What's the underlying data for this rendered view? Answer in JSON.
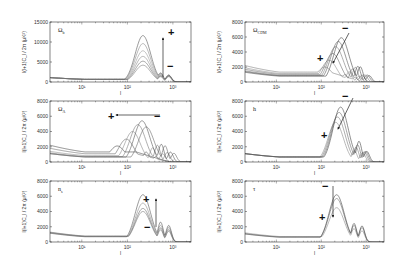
{
  "figure": {
    "ylabel": "l(l+1)C_l / 2π   (μ K²)",
    "xlabel": "l"
  },
  "chart_data": [
    {
      "type": "line",
      "id": "omega-b",
      "title": "Ω_b",
      "title_main": "Ω",
      "title_sub": "b",
      "xscale": "log",
      "xlim": [
        2,
        2500
      ],
      "ylim": [
        0,
        15000
      ],
      "yticks": [
        0,
        5000,
        10000,
        15000
      ],
      "xticks": [
        10,
        100,
        1000
      ],
      "xticklabels": [
        "10¹",
        "10²",
        "10³"
      ],
      "xlabel": "l",
      "ylabel": "l(l+1)C_l / 2π (μK²)",
      "arrow": {
        "direction": "up",
        "plus": "+",
        "minus": "−",
        "plus_at": "top"
      },
      "series": [
        {
          "name": "curve-1",
          "low": 1100,
          "p1": [
            220,
            4200
          ],
          "p2": [
            540,
            1500
          ],
          "p3": [
            820,
            1900
          ],
          "color": "#777"
        },
        {
          "name": "curve-2",
          "low": 1100,
          "p1": [
            220,
            5200
          ],
          "p2": [
            540,
            1700
          ],
          "p3": [
            820,
            2100
          ],
          "color": "#666"
        },
        {
          "name": "curve-3",
          "low": 1100,
          "p1": [
            220,
            6400
          ],
          "p2": [
            540,
            1900
          ],
          "p3": [
            820,
            2200
          ],
          "color": "#888"
        },
        {
          "name": "curve-4",
          "low": 1100,
          "p1": [
            220,
            7800
          ],
          "p2": [
            540,
            2100
          ],
          "p3": [
            820,
            2300
          ],
          "color": "#999"
        },
        {
          "name": "curve-5",
          "low": 1100,
          "p1": [
            220,
            9600
          ],
          "p2": [
            540,
            2400
          ],
          "p3": [
            820,
            2400
          ],
          "color": "#888"
        },
        {
          "name": "curve-6",
          "low": 1100,
          "p1": [
            220,
            11600
          ],
          "p2": [
            540,
            2600
          ],
          "p3": [
            820,
            2500
          ],
          "color": "#555"
        }
      ]
    },
    {
      "type": "line",
      "id": "omega-cdm",
      "title": "Ω_CDM",
      "title_main": "Ω",
      "title_sub": "CDM",
      "xscale": "log",
      "xlim": [
        2,
        2500
      ],
      "ylim": [
        0,
        8000
      ],
      "yticks": [
        0,
        2000,
        4000,
        6000,
        8000
      ],
      "xticks": [
        10,
        100,
        1000
      ],
      "xticklabels": [
        "10¹",
        "10²",
        "10³"
      ],
      "xlabel": "l",
      "ylabel": "l(l+1)C_l / 2π (μK²)",
      "arrow": {
        "direction": "diagonal-down-left",
        "plus": "+",
        "minus": "−",
        "plus_at": "bottom"
      },
      "series": [
        {
          "name": "curve-1",
          "low": 2200,
          "p1": [
            120,
            2000
          ],
          "p2": [
            340,
            900
          ],
          "p3": [
            560,
            700
          ],
          "color": "#777"
        },
        {
          "name": "curve-2",
          "low": 1900,
          "p1": [
            150,
            2900
          ],
          "p2": [
            420,
            1400
          ],
          "p3": [
            700,
            1000
          ],
          "color": "#888"
        },
        {
          "name": "curve-3",
          "low": 1700,
          "p1": [
            180,
            3800
          ],
          "p2": [
            500,
            1900
          ],
          "p3": [
            820,
            1300
          ],
          "color": "#666"
        },
        {
          "name": "curve-4",
          "low": 1500,
          "p1": [
            210,
            4700
          ],
          "p2": [
            580,
            2300
          ],
          "p3": [
            950,
            1500
          ],
          "color": "#777"
        },
        {
          "name": "curve-5",
          "low": 1400,
          "p1": [
            240,
            5400
          ],
          "p2": [
            660,
            2600
          ],
          "p3": [
            1080,
            1700
          ],
          "color": "#555"
        },
        {
          "name": "curve-6",
          "low": 1300,
          "p1": [
            280,
            5900
          ],
          "p2": [
            750,
            2700
          ],
          "p3": [
            1200,
            1800
          ],
          "color": "#444"
        }
      ]
    },
    {
      "type": "line",
      "id": "omega-lambda",
      "title": "Ω_Λ",
      "title_main": "Ω",
      "title_sub": "Λ",
      "xscale": "log",
      "xlim": [
        2,
        2500
      ],
      "ylim": [
        0,
        8000
      ],
      "yticks": [
        0,
        2000,
        4000,
        6000,
        8000
      ],
      "xticks": [
        10,
        100,
        1000
      ],
      "xticklabels": [
        "10¹",
        "10²",
        "10³"
      ],
      "xlabel": "l",
      "ylabel": "l(l+1)C_l / 2π (μK²)",
      "arrow": {
        "direction": "left",
        "plus": "+",
        "minus": "−",
        "plus_at": "left"
      },
      "series": [
        {
          "name": "curve-1",
          "low": 2200,
          "p1": [
            60,
            2100
          ],
          "p2": [
            160,
            600
          ],
          "p3": [
            280,
            400
          ],
          "color": "#444"
        },
        {
          "name": "curve-2",
          "low": 1800,
          "p1": [
            95,
            3000
          ],
          "p2": [
            260,
            1200
          ],
          "p3": [
            430,
            800
          ],
          "color": "#666"
        },
        {
          "name": "curve-3",
          "low": 1400,
          "p1": [
            130,
            4000
          ],
          "p2": [
            360,
            1900
          ],
          "p3": [
            600,
            1300
          ],
          "color": "#888"
        },
        {
          "name": "curve-4",
          "low": 1200,
          "p1": [
            170,
            4900
          ],
          "p2": [
            460,
            2400
          ],
          "p3": [
            760,
            1700
          ],
          "color": "#777"
        },
        {
          "name": "curve-5",
          "low": 1100,
          "p1": [
            210,
            5400
          ],
          "p2": [
            560,
            2700
          ],
          "p3": [
            900,
            2000
          ],
          "color": "#555"
        },
        {
          "name": "curve-6",
          "low": 1100,
          "p1": [
            260,
            4600
          ],
          "p2": [
            680,
            2700
          ],
          "p3": [
            1080,
            2100
          ],
          "color": "#666"
        }
      ]
    },
    {
      "type": "line",
      "id": "hubble-h",
      "title": "h",
      "title_main": "h",
      "title_sub": "",
      "xscale": "log",
      "xlim": [
        2,
        2500
      ],
      "ylim": [
        0,
        8000
      ],
      "yticks": [
        0,
        2000,
        4000,
        6000,
        8000
      ],
      "xticks": [
        10,
        100,
        1000
      ],
      "xticklabels": [
        "10¹",
        "10²",
        "10³"
      ],
      "xlabel": "l",
      "ylabel": "l(l+1)C_l / 2π (μK²)",
      "arrow": {
        "direction": "diagonal-down-left",
        "plus": "+",
        "minus": "−",
        "plus_at": "bottom"
      },
      "series": [
        {
          "name": "curve-1",
          "low": 1100,
          "p1": [
            210,
            5200
          ],
          "p2": [
            550,
            1700
          ],
          "p3": [
            850,
            1800
          ],
          "color": "#888"
        },
        {
          "name": "curve-2",
          "low": 1100,
          "p1": [
            230,
            5900
          ],
          "p2": [
            600,
            2300
          ],
          "p3": [
            920,
            2100
          ],
          "color": "#777"
        },
        {
          "name": "curve-3",
          "low": 1100,
          "p1": [
            250,
            6500
          ],
          "p2": [
            650,
            2800
          ],
          "p3": [
            990,
            2300
          ],
          "color": "#666"
        },
        {
          "name": "curve-4",
          "low": 1100,
          "p1": [
            270,
            7200
          ],
          "p2": [
            700,
            3500
          ],
          "p3": [
            1060,
            2500
          ],
          "color": "#444"
        }
      ]
    },
    {
      "type": "line",
      "id": "spectral-index",
      "title": "n_s",
      "title_main": "n",
      "title_sub": "s",
      "xscale": "log",
      "xlim": [
        2,
        2500
      ],
      "ylim": [
        0,
        8000
      ],
      "yticks": [
        0,
        2000,
        4000,
        6000,
        8000
      ],
      "xticks": [
        10,
        100,
        1000
      ],
      "xticklabels": [
        "10¹",
        "10²",
        "10³"
      ],
      "xlabel": "l",
      "ylabel": "l(l+1)C_l / 2π (μK²)",
      "arrow": {
        "direction": "up",
        "plus": "+",
        "minus": "−",
        "plus_at": "top"
      },
      "series": [
        {
          "name": "curve-1",
          "low": 1300,
          "p1": [
            220,
            4000
          ],
          "p2": [
            540,
            1800
          ],
          "p3": [
            820,
            2000
          ],
          "color": "#777"
        },
        {
          "name": "curve-2",
          "low": 1250,
          "p1": [
            220,
            4400
          ],
          "p2": [
            540,
            2100
          ],
          "p3": [
            820,
            2300
          ],
          "color": "#666"
        },
        {
          "name": "curve-3",
          "low": 1200,
          "p1": [
            220,
            5100
          ],
          "p2": [
            540,
            2500
          ],
          "p3": [
            820,
            2700
          ],
          "color": "#888"
        },
        {
          "name": "curve-4",
          "low": 1150,
          "p1": [
            220,
            6200
          ],
          "p2": [
            540,
            3000
          ],
          "p3": [
            820,
            3100
          ],
          "color": "#555"
        }
      ]
    },
    {
      "type": "line",
      "id": "optical-depth-tau",
      "title": "τ",
      "title_main": "τ",
      "title_sub": "",
      "xscale": "log",
      "xlim": [
        2,
        2500
      ],
      "ylim": [
        0,
        8000
      ],
      "yticks": [
        0,
        2000,
        4000,
        6000,
        8000
      ],
      "xticks": [
        10,
        100,
        1000
      ],
      "xticklabels": [
        "10¹",
        "10²",
        "10³"
      ],
      "xlabel": "l",
      "ylabel": "l(l+1)C_l / 2π (μK²)",
      "arrow": {
        "direction": "down",
        "plus": "+",
        "minus": "−",
        "plus_at": "bottom"
      },
      "series": [
        {
          "name": "curve-1",
          "low": 1200,
          "p1": [
            220,
            4500
          ],
          "p2": [
            540,
            2000
          ],
          "p3": [
            820,
            2100
          ],
          "color": "#888"
        },
        {
          "name": "curve-2",
          "low": 1100,
          "p1": [
            220,
            5700
          ],
          "p2": [
            540,
            2500
          ],
          "p3": [
            820,
            2700
          ],
          "color": "#666"
        },
        {
          "name": "curve-3",
          "low": 1050,
          "p1": [
            220,
            6200
          ],
          "p2": [
            540,
            2800
          ],
          "p3": [
            820,
            3000
          ],
          "color": "#444"
        }
      ]
    }
  ]
}
